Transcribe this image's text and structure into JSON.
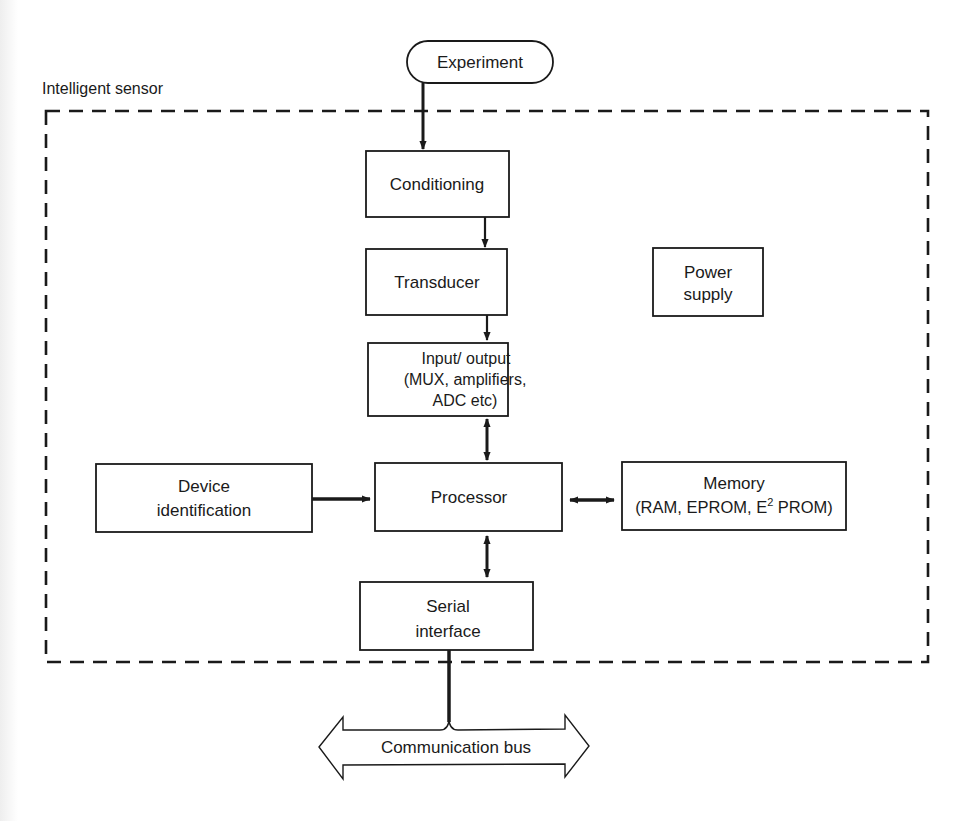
{
  "diagram": {
    "boundary_label": "Intelligent sensor",
    "colors": {
      "ink": "#1a1a1a",
      "background": "#ffffff"
    },
    "nodes": {
      "experiment": {
        "label": "Experiment",
        "shape": "rounded-terminal"
      },
      "conditioning": {
        "label": "Conditioning"
      },
      "transducer": {
        "label": "Transducer"
      },
      "power_supply": {
        "line1": "Power",
        "line2": "supply"
      },
      "io": {
        "line1": "Input/ output",
        "line2": "(MUX, amplifiers,",
        "line3": "ADC etc)"
      },
      "device_id": {
        "line1": "Device",
        "line2": "identification"
      },
      "processor": {
        "label": "Processor"
      },
      "memory": {
        "line1": "Memory",
        "line2a": "(RAM, EPROM, E",
        "line2sup": "2",
        "line2b": " PROM)"
      },
      "serial": {
        "line1": "Serial",
        "line2": "interface"
      },
      "bus": {
        "label": "Communication bus",
        "shape": "double-headed-arrow"
      }
    },
    "edges": [
      {
        "from": "Experiment",
        "to": "Conditioning",
        "type": "one-way"
      },
      {
        "from": "Conditioning",
        "to": "Transducer",
        "type": "one-way"
      },
      {
        "from": "Transducer",
        "to": "Input/ output",
        "type": "one-way"
      },
      {
        "from": "Input/ output",
        "to": "Processor",
        "type": "two-way"
      },
      {
        "from": "Device identification",
        "to": "Processor",
        "type": "one-way"
      },
      {
        "from": "Processor",
        "to": "Memory",
        "type": "two-way"
      },
      {
        "from": "Processor",
        "to": "Serial interface",
        "type": "two-way"
      },
      {
        "from": "Serial interface",
        "to": "Communication bus",
        "type": "line"
      }
    ]
  }
}
